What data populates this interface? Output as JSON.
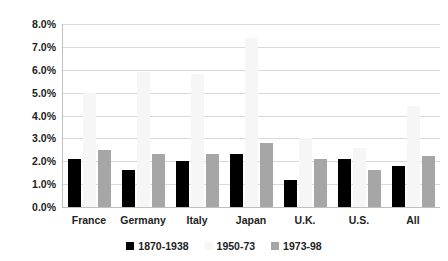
{
  "chart_data": {
    "type": "bar",
    "title": "",
    "subtitle": "",
    "xlabel": "",
    "ylabel": "",
    "ylim": [
      0,
      8
    ],
    "ytick_labels": [
      "0.0%",
      "1.0%",
      "2.0%",
      "3.0%",
      "4.0%",
      "5.0%",
      "6.0%",
      "7.0%",
      "8.0%"
    ],
    "ytick_values": [
      0,
      1,
      2,
      3,
      4,
      5,
      6,
      7,
      8
    ],
    "grid": true,
    "legend_position": "bottom",
    "categories": [
      "France",
      "Germany",
      "Italy",
      "Japan",
      "U.K.",
      "U.S.",
      "All"
    ],
    "series": [
      {
        "name": "1870-1938",
        "color": "#000000",
        "values": [
          2.1,
          1.6,
          2.0,
          2.3,
          1.2,
          2.1,
          1.8
        ]
      },
      {
        "name": "1950-73",
        "color": "#f6f6f6",
        "values": [
          5.0,
          5.9,
          5.8,
          7.4,
          3.0,
          2.6,
          4.4
        ]
      },
      {
        "name": "1973-98",
        "color": "#a6a6a6",
        "values": [
          2.5,
          2.3,
          2.3,
          2.8,
          2.1,
          1.6,
          2.25
        ]
      }
    ]
  }
}
